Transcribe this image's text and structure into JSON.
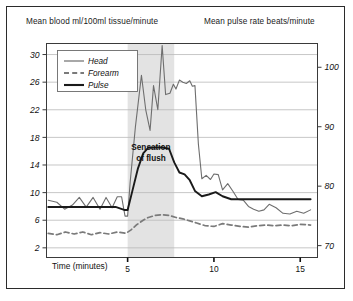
{
  "figure": {
    "title_left": "Mean blood ml/100ml tissue/minute",
    "title_right": "Mean pulse rate beats/minute",
    "annotation_line1": "Sensation",
    "annotation_line2": "of flush",
    "border_color": "#2b2b2b",
    "shade_color": "#e3e3e3"
  },
  "legend": {
    "items": [
      {
        "label": "Head",
        "style": "solid-thin",
        "color": "#6e6e6e"
      },
      {
        "label": "Forearm",
        "style": "dashed",
        "color": "#7a7a7a"
      },
      {
        "label": "Pulse",
        "style": "solid-thick",
        "color": "#1a1a1a"
      }
    ]
  },
  "chart_data": {
    "type": "line",
    "title": "Mean blood ml/100ml tissue/minute",
    "xlabel": "Time (minutes)",
    "ylabel": "Mean blood ml/100ml tissue/minute",
    "ylabel_right": "Mean pulse rate beats/minute",
    "xlim": [
      0.3,
      16.0
    ],
    "ylim": [
      0.6,
      31.6
    ],
    "ylim_right": [
      68.0,
      104.0
    ],
    "yticks": [
      2,
      6,
      10,
      14,
      18,
      22,
      26,
      30
    ],
    "yticks_right": [
      70,
      80,
      90,
      100
    ],
    "xticks": [
      5,
      10,
      15
    ],
    "grid": true,
    "legend_position": "upper-left",
    "annotations": [
      {
        "text": "Sensation of flush",
        "type": "shaded-band",
        "x_start": 5.0,
        "x_end": 7.7
      }
    ],
    "series": [
      {
        "name": "Head",
        "axis": "left",
        "x": [
          0.4,
          0.9,
          1.35,
          1.8,
          2.2,
          2.6,
          3.0,
          3.4,
          3.75,
          4.1,
          4.4,
          4.65,
          4.85,
          5.0,
          5.15,
          5.45,
          5.8,
          6.05,
          6.3,
          6.5,
          6.75,
          7.0,
          7.2,
          7.45,
          7.65,
          7.8,
          8.0,
          8.2,
          8.4,
          8.6,
          8.75,
          8.9,
          9.1,
          9.3,
          9.55,
          9.8,
          10.0,
          10.25,
          10.5,
          10.8,
          11.1,
          11.4,
          11.7,
          12.0,
          12.3,
          12.6,
          12.9,
          13.2,
          13.6,
          14.0,
          14.4,
          14.8,
          15.2,
          15.6
        ],
        "y": [
          8.9,
          8.6,
          7.6,
          8.2,
          9.3,
          7.9,
          9.3,
          7.6,
          9.3,
          7.8,
          9.4,
          9.4,
          6.6,
          6.6,
          11.6,
          19.5,
          27.0,
          22.0,
          19.0,
          25.5,
          22.0,
          31.3,
          24.2,
          24.4,
          25.7,
          25.0,
          26.3,
          26.0,
          25.8,
          26.2,
          25.4,
          25.5,
          17.0,
          12.0,
          12.5,
          11.9,
          12.7,
          12.6,
          10.4,
          11.3,
          10.2,
          9.0,
          8.9,
          8.0,
          7.6,
          7.3,
          7.5,
          8.3,
          7.8,
          7.0,
          6.9,
          7.3,
          7.0,
          7.5
        ]
      },
      {
        "name": "Forearm",
        "axis": "left",
        "x": [
          0.4,
          0.9,
          1.4,
          1.9,
          2.4,
          2.9,
          3.4,
          3.9,
          4.4,
          4.9,
          5.2,
          5.5,
          5.9,
          6.2,
          6.6,
          7.0,
          7.4,
          7.8,
          8.2,
          8.6,
          9.0,
          9.5,
          10.0,
          10.5,
          11.0,
          11.5,
          12.0,
          12.5,
          13.0,
          13.5,
          14.0,
          14.5,
          15.0,
          15.6
        ],
        "y": [
          4.1,
          3.9,
          4.3,
          4.0,
          4.3,
          3.9,
          4.2,
          4.0,
          4.3,
          4.1,
          4.6,
          5.3,
          6.0,
          6.4,
          6.7,
          6.8,
          6.7,
          6.4,
          6.2,
          5.9,
          5.6,
          5.2,
          5.1,
          5.5,
          5.3,
          5.1,
          5.0,
          5.2,
          5.3,
          5.2,
          5.3,
          5.2,
          5.4,
          5.3
        ]
      },
      {
        "name": "Pulse",
        "axis": "right",
        "x": [
          0.4,
          1.2,
          2.0,
          2.8,
          3.6,
          4.3,
          4.8,
          5.0,
          5.3,
          5.6,
          5.9,
          6.2,
          6.6,
          7.0,
          7.4,
          7.7,
          8.0,
          8.3,
          8.6,
          8.9,
          9.3,
          9.7,
          10.1,
          10.5,
          11.0,
          11.5,
          12.0,
          12.6,
          13.2,
          13.8,
          14.4,
          15.0,
          15.6
        ],
        "y": [
          76.5,
          76.5,
          76.5,
          76.5,
          76.5,
          76.5,
          76.0,
          76.0,
          79.5,
          83.0,
          85.5,
          86.5,
          86.5,
          86.5,
          86.3,
          84.0,
          82.3,
          82.0,
          81.0,
          79.2,
          78.3,
          78.6,
          79.0,
          78.3,
          77.8,
          77.8,
          77.8,
          77.8,
          77.8,
          77.8,
          77.8,
          77.8,
          77.8
        ]
      }
    ]
  },
  "axes": {
    "x_axis_label": "Time (minutes)"
  }
}
